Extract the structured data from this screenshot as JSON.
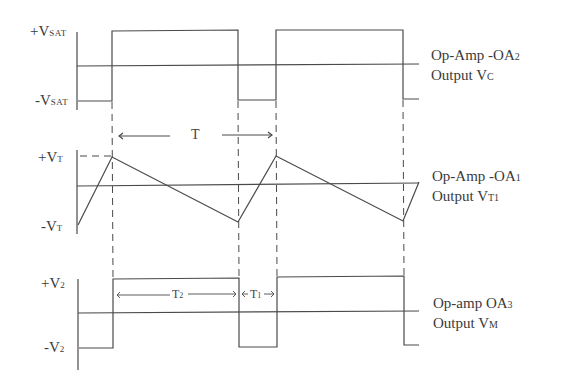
{
  "diagram": {
    "type": "waveform-timing-diagram",
    "waveforms": [
      {
        "id": "oa2",
        "title": "Op-Amp -OA",
        "title_sub": "2",
        "output_label": "Output V",
        "output_sub": "C",
        "y_labels": [
          {
            "prefix": "+V",
            "sub": "SAT"
          },
          {
            "prefix": "-V",
            "sub": "SAT"
          }
        ],
        "shape": "square"
      },
      {
        "id": "oa1",
        "title": "Op-Amp -OA",
        "title_sub": "1",
        "output_label": "Output V",
        "output_sub": "T1",
        "y_labels": [
          {
            "prefix": "+V",
            "sub": "T"
          },
          {
            "prefix": "-V",
            "sub": "T"
          }
        ],
        "shape": "triangle"
      },
      {
        "id": "oa3",
        "title": "Op-amp OA",
        "title_sub": "3",
        "output_label": "Output V",
        "output_sub": "M",
        "y_labels": [
          {
            "prefix": "+V",
            "sub": "2"
          },
          {
            "prefix": "-V",
            "sub": "2"
          }
        ],
        "shape": "pulse"
      }
    ],
    "annotations": {
      "period": "T",
      "t2": {
        "prefix": "T",
        "sub": "2"
      },
      "t1": {
        "prefix": "T",
        "sub": "1"
      }
    },
    "line_color": "#444444"
  }
}
